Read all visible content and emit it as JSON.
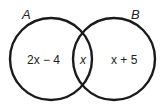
{
  "diagram": {
    "type": "venn",
    "sets": [
      {
        "name": "A",
        "label": "A"
      },
      {
        "name": "B",
        "label": "B"
      }
    ],
    "regions": {
      "a_only": "2x − 4",
      "intersection": "x",
      "b_only": "x + 5"
    },
    "stroke_color": "#1a1a1a"
  }
}
